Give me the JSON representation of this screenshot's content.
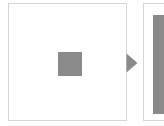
{
  "figure": {
    "type": "zoom-illustration",
    "background_color": "#ffffff",
    "panel_border_color": "#d6d6d6",
    "swatch_color": "#8a8a8a",
    "arrow_color": "#8a8a8a",
    "source_panel": {
      "label": "",
      "content_label": "",
      "swatch": {
        "name": "gray-square",
        "color": "#8a8a8a",
        "x": 49,
        "y": 48,
        "width": 24,
        "height": 24
      }
    },
    "arrow": {
      "name": "right-arrow-icon",
      "direction": "right",
      "color": "#8a8a8a"
    },
    "zoomed_panel": {
      "label": "",
      "content_label": "",
      "cropped": true,
      "block": {
        "name": "magnified-gray-block",
        "color": "#8a8a8a",
        "x": 9,
        "y": 11,
        "width": 96,
        "height": 99
      }
    }
  }
}
